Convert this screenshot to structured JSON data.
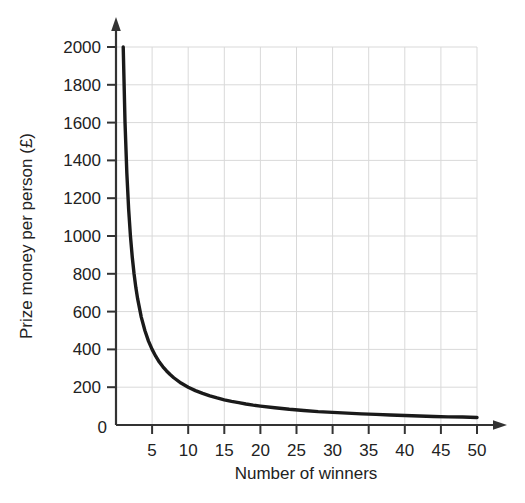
{
  "chart_data": {
    "type": "line",
    "title": "",
    "xlabel": "Number of winners",
    "ylabel": "Prize money per person (£)",
    "xlim": [
      0,
      50
    ],
    "ylim": [
      0,
      2000
    ],
    "grid": true,
    "legend": "none",
    "relationship": "y = 2000 / x",
    "x_ticks": [
      0,
      5,
      10,
      15,
      20,
      25,
      30,
      35,
      40,
      45,
      50
    ],
    "x_tick_labels": [
      "0",
      "5",
      "10",
      "15",
      "20",
      "25",
      "30",
      "35",
      "40",
      "45",
      "50"
    ],
    "y_ticks": [
      0,
      200,
      400,
      600,
      800,
      1000,
      1200,
      1400,
      1600,
      1800,
      2000
    ],
    "y_tick_labels": [
      "0",
      "200",
      "400",
      "600",
      "800",
      "1000",
      "1200",
      "1400",
      "1600",
      "1800",
      "2000"
    ],
    "series": [
      {
        "name": "Prize money per person",
        "color": "#1a1a1a",
        "x": [
          1,
          1.25,
          1.5,
          1.75,
          2,
          2.25,
          2.5,
          2.75,
          3,
          3.5,
          4,
          4.5,
          5,
          5.5,
          6,
          6.5,
          7,
          7.5,
          8,
          9,
          10,
          11,
          12,
          13,
          14,
          15,
          16,
          17,
          18,
          19,
          20,
          22,
          24,
          26,
          28,
          30,
          32,
          34,
          36,
          38,
          40,
          42,
          44,
          46,
          48,
          50
        ],
        "values": [
          2000,
          1600,
          1333,
          1143,
          1000,
          889,
          800,
          727,
          667,
          571,
          500,
          444,
          400,
          364,
          333,
          308,
          286,
          267,
          250,
          222,
          200,
          182,
          167,
          154,
          143,
          133,
          125,
          118,
          111,
          105,
          100,
          91,
          83,
          77,
          71,
          67,
          63,
          59,
          56,
          53,
          50,
          48,
          45,
          43,
          42,
          40
        ]
      }
    ]
  },
  "style": {
    "axis_color": "#333333",
    "grid_color": "#d9d9d9",
    "curve_color": "#1a1a1a",
    "background": "#ffffff"
  },
  "axes": {
    "x_axis_name": "Number of winners",
    "y_axis_name": "Prize money per person (£)",
    "origin_label": "0"
  }
}
